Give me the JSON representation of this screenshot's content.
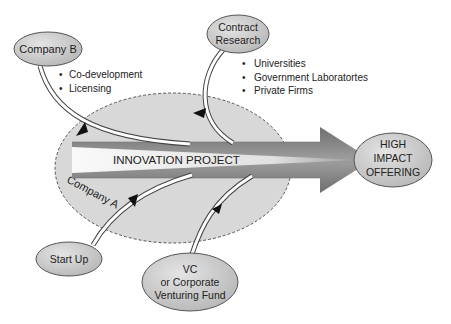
{
  "diagram": {
    "center": {
      "arrow_label": "INNOVATION PROJECT",
      "boundary_label": "Company A"
    },
    "target": {
      "lines": [
        "HIGH",
        "IMPACT",
        "OFFERING"
      ]
    },
    "sources": [
      {
        "id": "company-b",
        "lines": [
          "Company B"
        ],
        "bullets": [
          "Co-development",
          "Licensing"
        ]
      },
      {
        "id": "contract-research",
        "lines": [
          "Contract",
          "Research"
        ],
        "bullets": [
          "Universities",
          "Government Laboratortes",
          "Private Firms"
        ]
      },
      {
        "id": "start-up",
        "lines": [
          "Start Up"
        ],
        "bullets": []
      },
      {
        "id": "vc-fund",
        "lines": [
          "VC",
          "or Corporate",
          "Venturing Fund"
        ],
        "bullets": []
      }
    ],
    "bullet_glyph": "•",
    "colors": {
      "node_fill": "#c8c8c8",
      "node_stroke": "#555555",
      "boundary_fill": "#d9d9d9",
      "arrow_dark": "#7a7a7a",
      "arrow_light": "#f4f4f4"
    }
  }
}
